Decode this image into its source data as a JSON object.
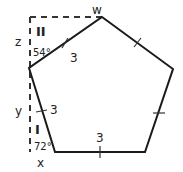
{
  "diagram": {
    "labels": {
      "w": "w",
      "z": "z",
      "y": "y",
      "x": "x",
      "region_top": "II",
      "region_bottom": "I",
      "angle_top": "54°",
      "angle_bottom": "72°",
      "side_top_left": "3",
      "side_left": "3",
      "side_bottom": "3"
    },
    "colors": {
      "stroke": "#1a1a1a",
      "dash": "#333333"
    }
  }
}
